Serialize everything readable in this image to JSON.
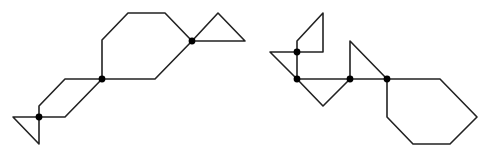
{
  "diagram": {
    "width": 489,
    "height": 152,
    "stroke_color": "#222222",
    "node_color": "#000000",
    "figures": [
      {
        "name": "left-figure",
        "polylines": [
          {
            "name": "left-triangle",
            "points": [
              [
                13,
                117
              ],
              [
                39,
                117
              ],
              [
                39,
                144
              ],
              [
                13,
                117
              ]
            ]
          },
          {
            "name": "left-parallelogram",
            "points": [
              [
                39,
                117
              ],
              [
                39,
                106
              ],
              [
                65,
                79
              ],
              [
                102,
                79
              ],
              [
                65,
                117
              ],
              [
                39,
                117
              ]
            ]
          },
          {
            "name": "octagon-body",
            "points": [
              [
                102,
                79
              ],
              [
                102,
                40
              ],
              [
                128,
                13
              ],
              [
                165,
                13
              ],
              [
                192,
                41
              ],
              [
                155,
                79
              ],
              [
                102,
                79
              ]
            ]
          },
          {
            "name": "right-triangle",
            "points": [
              [
                192,
                41
              ],
              [
                218,
                13
              ],
              [
                245,
                41
              ],
              [
                192,
                41
              ]
            ]
          }
        ],
        "nodes": [
          [
            39,
            117
          ],
          [
            102,
            79
          ],
          [
            192,
            41
          ]
        ]
      },
      {
        "name": "right-figure",
        "polylines": [
          {
            "name": "top-quadrilateral",
            "points": [
              [
                297,
                52
              ],
              [
                297,
                41
              ],
              [
                323,
                13
              ],
              [
                323,
                52
              ],
              [
                297,
                52
              ]
            ]
          },
          {
            "name": "left-triangle",
            "points": [
              [
                297,
                52
              ],
              [
                270,
                52
              ],
              [
                297,
                79
              ],
              [
                297,
                52
              ]
            ]
          },
          {
            "name": "bottom-v",
            "points": [
              [
                297,
                79
              ],
              [
                323,
                106
              ],
              [
                350,
                79
              ]
            ]
          },
          {
            "name": "baseline",
            "points": [
              [
                297,
                79
              ],
              [
                387,
                79
              ]
            ]
          },
          {
            "name": "middle-triangle",
            "points": [
              [
                350,
                79
              ],
              [
                350,
                41
              ],
              [
                387,
                79
              ]
            ]
          },
          {
            "name": "hexagon",
            "points": [
              [
                387,
                79
              ],
              [
                440,
                79
              ],
              [
                477,
                117
              ],
              [
                450,
                144
              ],
              [
                413,
                144
              ],
              [
                387,
                117
              ],
              [
                387,
                79
              ]
            ]
          }
        ],
        "nodes": [
          [
            297,
            52
          ],
          [
            297,
            79
          ],
          [
            350,
            79
          ],
          [
            387,
            79
          ]
        ]
      }
    ]
  }
}
